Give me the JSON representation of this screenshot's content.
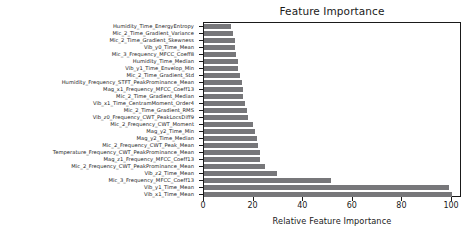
{
  "chart_data": {
    "type": "bar",
    "orientation": "horizontal",
    "title": "Feature Importance",
    "xlabel": "Relative Feature Importance",
    "ylabel": "",
    "xlim": [
      0,
      104
    ],
    "xticks": [
      0,
      20,
      40,
      60,
      80,
      100
    ],
    "xticklabels": [
      "0",
      "20",
      "40",
      "60",
      "80",
      "100"
    ],
    "grid": false,
    "legend": null,
    "bar_color": "#77777a",
    "categories": [
      "Humidity_Time_EnergyEntropy",
      "Mic_2_Time_Gradient_Variance",
      "Mic_2_Time_Gradient_Skewness",
      "Vib_y0_Time_Mean",
      "Mic_3_Frequency_MFCC_Coeff8",
      "Humidity_Time_Median",
      "Vib_y1_Time_Envelop_Min",
      "Mic_2_Time_Gradient_Std",
      "Humidity_Frequency_STFT_PeakProminance_Mean",
      "Mag_x1_Frequency_MFCC_Coeff13",
      "Mic_2_Time_Gradient_Median",
      "Vib_x1_Time_CentramMoment_Order4",
      "Mic_2_Time_Gradient_RMS",
      "Vib_z0_Frequency_CWT_PeakLocsDiff9",
      "Mic_2_Frequency_CWT_Moment",
      "Mag_y2_Time_Min",
      "Mag_y2_Time_Median",
      "Mic_2_Frequency_CWT_Peak_Mean",
      "Temperature_Frequency_CWT_PeakProminance_Mean",
      "Mag_z1_Frequency_MFCC_Coeff13",
      "Mic_2_Frequency_CWT_PeakProminance_Mean",
      "Vib_z2_Time_Mean",
      "Mic_3_Frequency_MFCC_Coeff13",
      "Vib_y1_Time_Mean",
      "Vib_x1_Time_Mean"
    ],
    "values": [
      11.0,
      11.7,
      12.3,
      12.6,
      13.1,
      13.8,
      13.9,
      14.5,
      15.2,
      15.6,
      15.9,
      16.6,
      17.3,
      17.6,
      19.9,
      20.7,
      21.2,
      21.8,
      22.5,
      22.7,
      24.4,
      29.3,
      51.2,
      98.7,
      100.0
    ]
  }
}
